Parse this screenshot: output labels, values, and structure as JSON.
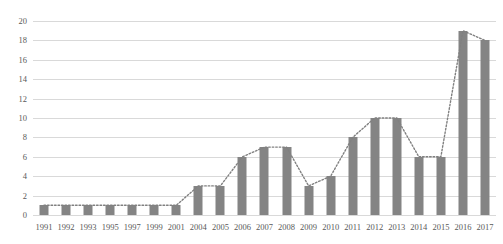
{
  "chart_data": {
    "type": "bar",
    "title": "",
    "subtitle": "",
    "xlabel": "",
    "ylabel": "",
    "categories": [
      "1991",
      "1992",
      "1993",
      "1995",
      "1997",
      "1999",
      "2001",
      "2004",
      "2005",
      "2006",
      "2007",
      "2008",
      "2009",
      "2010",
      "2011",
      "2012",
      "2013",
      "2014",
      "2015",
      "2016",
      "2017"
    ],
    "values": [
      1,
      1,
      1,
      1,
      1,
      1,
      1,
      3,
      3,
      6,
      7,
      7,
      3,
      4,
      8,
      10,
      10,
      6,
      6,
      19,
      18
    ],
    "series": [
      {
        "name": "bars",
        "type": "bar",
        "values": [
          1,
          1,
          1,
          1,
          1,
          1,
          1,
          3,
          3,
          6,
          7,
          7,
          3,
          4,
          8,
          10,
          10,
          6,
          6,
          19,
          18
        ]
      },
      {
        "name": "trend",
        "type": "line",
        "style": "dotted",
        "values": [
          1,
          1,
          1,
          1,
          1,
          1,
          1,
          3,
          3,
          6,
          7,
          7,
          3,
          4,
          8,
          10,
          10,
          6,
          6,
          19,
          18
        ]
      }
    ],
    "ylim": [
      0,
      20
    ],
    "ytick_values": [
      0,
      2,
      4,
      6,
      8,
      10,
      12,
      14,
      16,
      18,
      20
    ],
    "ytick_labels": [
      "0",
      "2",
      "4",
      "6",
      "8",
      "10",
      "12",
      "14",
      "16",
      "18",
      "20"
    ],
    "grid": true,
    "legend": "none",
    "legend_entries": [],
    "annotations": []
  },
  "style": {
    "bar_color": "#848484",
    "gridline_color": "#d9d9d9",
    "line_color": "#808080",
    "tick_label_color": "#595959",
    "background": "#ffffff"
  }
}
